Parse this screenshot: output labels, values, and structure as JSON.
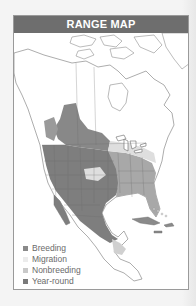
{
  "title": "RANGE MAP",
  "legend": {
    "items": [
      {
        "label": "Breeding",
        "color": "#8a8a8a"
      },
      {
        "label": "Migration",
        "color": "#ececec"
      },
      {
        "label": "Nonbreeding",
        "color": "#c9c9c9"
      },
      {
        "label": "Year-round",
        "color": "#7a7a7a"
      }
    ]
  },
  "colors": {
    "header": "#6e6e6e",
    "land": "#ffffff",
    "border": "#9a9a9a",
    "breeding": "#8a8a8a",
    "yearround": "#7d7d7d",
    "nonbreeding": "#a6a6a6",
    "migration": "#dcdcdc"
  },
  "map": {
    "region": "North and Central America",
    "species_range": "Breeding, migration, nonbreeding and year-round ranges shaded"
  }
}
